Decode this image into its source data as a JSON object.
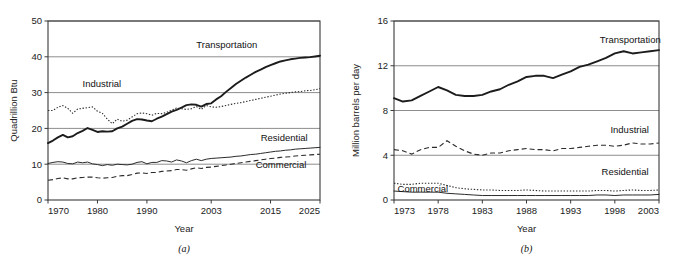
{
  "figure": {
    "background": "#ffffff",
    "panels": [
      {
        "caption": "(a)",
        "xlabel": "Year",
        "ylabel": "Quadrillion Btu"
      },
      {
        "caption": "(b)",
        "xlabel": "Year",
        "ylabel": "Million barrels per day"
      }
    ]
  },
  "chart_data": [
    {
      "type": "line",
      "title": "",
      "xlabel": "Year",
      "ylabel": "Quadrillion Btu",
      "caption": "(a)",
      "grid": true,
      "legend": "inline-annotations",
      "xlim": [
        1970,
        2025
      ],
      "ylim": [
        0,
        50
      ],
      "xticks": [
        1970,
        1980,
        1990,
        2003,
        2015,
        2025
      ],
      "xtick_labels": [
        "1970",
        "1980",
        "1990",
        "2003",
        "2015",
        "2025"
      ],
      "yticks": [
        0,
        10,
        20,
        30,
        40,
        50
      ],
      "ytick_labels": [
        "0",
        "10",
        "20",
        "30",
        "40",
        "50"
      ],
      "x": [
        1970,
        1971,
        1972,
        1973,
        1974,
        1975,
        1976,
        1977,
        1978,
        1979,
        1980,
        1981,
        1982,
        1983,
        1984,
        1985,
        1986,
        1987,
        1988,
        1989,
        1990,
        1991,
        1992,
        1993,
        1994,
        1995,
        1996,
        1997,
        1998,
        1999,
        2000,
        2001,
        2002,
        2003,
        2004,
        2005,
        2006,
        2007,
        2008,
        2009,
        2010,
        2011,
        2012,
        2013,
        2014,
        2015,
        2016,
        2017,
        2018,
        2019,
        2020,
        2021,
        2022,
        2023,
        2024,
        2025
      ],
      "series": [
        {
          "name": "Transportation",
          "style": "solid-thick",
          "label_x": 2000,
          "label_y": 42.5,
          "values": [
            15.9,
            16.6,
            17.5,
            18.2,
            17.5,
            17.8,
            18.7,
            19.3,
            20.1,
            19.6,
            19.0,
            19.2,
            19.1,
            19.2,
            20.0,
            20.5,
            21.3,
            22.1,
            22.6,
            22.5,
            22.2,
            22.0,
            22.7,
            23.3,
            24.0,
            24.7,
            25.2,
            25.8,
            26.5,
            26.7,
            26.6,
            26.1,
            26.8,
            27.0,
            28.1,
            29.0,
            30.2,
            31.3,
            32.4,
            33.3,
            34.2,
            35.0,
            35.8,
            36.4,
            37.1,
            37.7,
            38.2,
            38.7,
            39.0,
            39.3,
            39.5,
            39.7,
            39.8,
            39.9,
            40.1,
            40.3
          ]
        },
        {
          "name": "Industrial",
          "style": "dotted",
          "label_x": 1977,
          "label_y": 31.5,
          "values": [
            25.0,
            25.0,
            25.9,
            26.4,
            25.6,
            24.2,
            25.4,
            25.6,
            25.8,
            26.0,
            24.8,
            24.2,
            22.6,
            21.3,
            22.6,
            22.0,
            22.3,
            23.2,
            24.1,
            24.3,
            24.1,
            23.7,
            24.2,
            24.1,
            24.5,
            25.1,
            25.7,
            25.5,
            25.3,
            25.5,
            26.1,
            25.3,
            26.4,
            26.0,
            25.9,
            26.1,
            26.4,
            26.7,
            27.0,
            27.2,
            27.5,
            27.8,
            28.1,
            28.4,
            28.7,
            29.0,
            29.3,
            29.6,
            29.8,
            30.0,
            30.2,
            30.3,
            30.5,
            30.6,
            30.8,
            31.1
          ]
        },
        {
          "name": "Residential",
          "style": "solid-thin",
          "label_x": 2013,
          "label_y": 16.4,
          "values": [
            10.2,
            10.5,
            10.7,
            10.6,
            10.2,
            10.1,
            10.6,
            10.4,
            10.6,
            10.1,
            9.9,
            9.6,
            9.9,
            9.7,
            10.0,
            9.9,
            9.8,
            10.0,
            10.5,
            10.7,
            10.1,
            10.5,
            10.5,
            11.0,
            10.9,
            10.6,
            11.2,
            10.9,
            10.4,
            11.0,
            11.4,
            11.0,
            11.4,
            11.6,
            11.7,
            11.8,
            11.9,
            12.0,
            12.2,
            12.3,
            12.5,
            12.7,
            12.8,
            13.0,
            13.2,
            13.4,
            13.6,
            13.7,
            13.9,
            14.0,
            14.2,
            14.3,
            14.4,
            14.5,
            14.6,
            14.7
          ]
        },
        {
          "name": "Commercial",
          "style": "dashed",
          "label_x": 2012,
          "label_y": 9.0,
          "values": [
            5.5,
            5.7,
            6.0,
            6.2,
            5.9,
            5.9,
            6.2,
            6.3,
            6.4,
            6.4,
            6.2,
            6.1,
            6.2,
            6.3,
            6.6,
            6.8,
            6.8,
            7.1,
            7.5,
            7.6,
            7.4,
            7.7,
            7.7,
            8.0,
            8.1,
            8.2,
            8.5,
            8.5,
            8.3,
            8.7,
            9.0,
            8.8,
            9.1,
            9.2,
            9.4,
            9.6,
            9.8,
            10.0,
            10.2,
            10.4,
            10.6,
            10.8,
            11.0,
            11.2,
            11.4,
            11.6,
            11.7,
            11.9,
            12.0,
            12.1,
            12.3,
            12.4,
            12.5,
            12.6,
            12.7,
            12.8
          ]
        }
      ]
    },
    {
      "type": "line",
      "title": "",
      "xlabel": "Year",
      "ylabel": "Million barrels per day",
      "caption": "(b)",
      "grid": true,
      "legend": "inline-annotations",
      "xlim": [
        1973,
        2003
      ],
      "ylim": [
        0,
        16
      ],
      "xticks": [
        1973,
        1978,
        1983,
        1988,
        1993,
        1998,
        2003
      ],
      "xtick_labels": [
        "1973",
        "1978",
        "1983",
        "1988",
        "1993",
        "1998",
        "2003"
      ],
      "yticks": [
        0,
        4,
        8,
        12,
        16
      ],
      "ytick_labels": [
        "0",
        "4",
        "8",
        "12",
        "16"
      ],
      "x": [
        1973,
        1974,
        1975,
        1976,
        1977,
        1978,
        1979,
        1980,
        1981,
        1982,
        1983,
        1984,
        1985,
        1986,
        1987,
        1988,
        1989,
        1990,
        1991,
        1992,
        1993,
        1994,
        1995,
        1996,
        1997,
        1998,
        1999,
        2000,
        2001,
        2002,
        2003
      ],
      "series": [
        {
          "name": "Transportation",
          "style": "solid-thick",
          "label_x": 1996.3,
          "label_y": 14.0,
          "values": [
            9.1,
            8.8,
            8.9,
            9.3,
            9.7,
            10.1,
            9.8,
            9.4,
            9.3,
            9.3,
            9.4,
            9.7,
            9.9,
            10.3,
            10.6,
            11.0,
            11.1,
            11.1,
            10.9,
            11.2,
            11.5,
            11.9,
            12.1,
            12.4,
            12.7,
            13.1,
            13.3,
            13.1,
            13.2,
            13.3,
            13.4
          ]
        },
        {
          "name": "Industrial",
          "style": "dashed",
          "label_x": 1997.5,
          "label_y": 6.0,
          "values": [
            4.5,
            4.4,
            4.1,
            4.5,
            4.7,
            4.7,
            5.3,
            4.8,
            4.4,
            4.1,
            4.0,
            4.2,
            4.2,
            4.4,
            4.5,
            4.6,
            4.5,
            4.5,
            4.4,
            4.6,
            4.6,
            4.7,
            4.8,
            4.9,
            4.9,
            4.8,
            4.9,
            5.1,
            5.0,
            5.0,
            5.1
          ]
        },
        {
          "name": "Residential",
          "style": "dotted",
          "label_x": 1996.5,
          "label_y": 2.2,
          "values": [
            1.5,
            1.4,
            1.4,
            1.5,
            1.5,
            1.5,
            1.3,
            1.1,
            1.0,
            0.95,
            0.9,
            0.9,
            0.85,
            0.85,
            0.85,
            0.9,
            0.85,
            0.8,
            0.8,
            0.8,
            0.8,
            0.8,
            0.8,
            0.85,
            0.85,
            0.8,
            0.85,
            0.9,
            0.85,
            0.85,
            0.9
          ]
        },
        {
          "name": "Commercial",
          "style": "solid-thin",
          "label_x": 1973.4,
          "label_y": 0.75,
          "values": [
            0.8,
            0.75,
            0.7,
            0.7,
            0.7,
            0.7,
            0.6,
            0.55,
            0.5,
            0.45,
            0.4,
            0.4,
            0.4,
            0.4,
            0.4,
            0.4,
            0.4,
            0.4,
            0.4,
            0.4,
            0.4,
            0.4,
            0.4,
            0.45,
            0.45,
            0.4,
            0.45,
            0.45,
            0.45,
            0.45,
            0.5
          ]
        }
      ]
    }
  ]
}
